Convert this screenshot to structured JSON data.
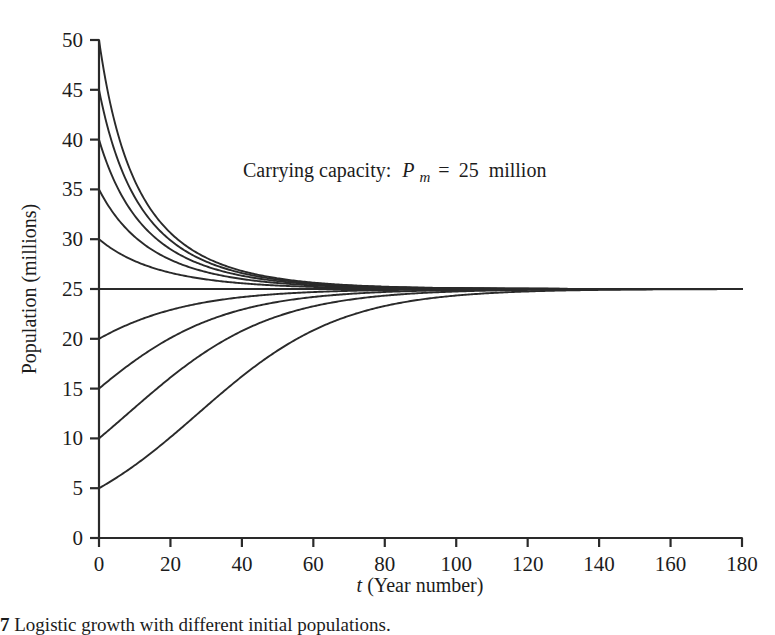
{
  "figure": {
    "caption_number": "7",
    "caption_text": "Logistic growth with different initial populations."
  },
  "annotation": {
    "prefix": "Carrying capacity:",
    "symbol": "P",
    "subscript": "m",
    "equals": "=",
    "value": "25",
    "unit": "million",
    "full_text": "Carrying capacity: Pm = 25 million"
  },
  "chart_data": {
    "type": "line",
    "title": "",
    "subtitle": "",
    "xlabel": "t (Year number)",
    "ylabel": "Population (millions)",
    "xlim": [
      0,
      180
    ],
    "ylim": [
      0,
      50
    ],
    "xticks": [
      0,
      20,
      40,
      60,
      80,
      100,
      120,
      140,
      160,
      180
    ],
    "yticks": [
      0,
      5,
      10,
      15,
      20,
      25,
      30,
      35,
      40,
      45,
      50
    ],
    "grid": false,
    "legend": "none",
    "carrying_capacity": 25,
    "growth_rate": 0.05,
    "model": "logistic",
    "annotations": [
      {
        "text": "Carrying capacity: Pm = 25 million",
        "x": 90,
        "y": 39
      }
    ],
    "series": [
      {
        "name": "P0 = 50",
        "initial_population": 50,
        "color": "#2a2a2a"
      },
      {
        "name": "P0 = 45",
        "initial_population": 45,
        "color": "#2a2a2a"
      },
      {
        "name": "P0 = 40",
        "initial_population": 40,
        "color": "#2a2a2a"
      },
      {
        "name": "P0 = 35",
        "initial_population": 35,
        "color": "#2a2a2a"
      },
      {
        "name": "P0 = 30",
        "initial_population": 30,
        "color": "#2a2a2a"
      },
      {
        "name": "P0 = 25",
        "initial_population": 25,
        "color": "#2a2a2a"
      },
      {
        "name": "P0 = 20",
        "initial_population": 20,
        "color": "#2a2a2a"
      },
      {
        "name": "P0 = 15",
        "initial_population": 15,
        "color": "#2a2a2a"
      },
      {
        "name": "P0 = 10",
        "initial_population": 10,
        "color": "#2a2a2a"
      },
      {
        "name": "P0 = 5",
        "initial_population": 5,
        "color": "#2a2a2a"
      },
      {
        "name": "P0 = 0",
        "initial_population": 0,
        "color": "#2a2a2a"
      }
    ]
  },
  "colors": {
    "background": "#ffffff",
    "axis": "#2a2a2a",
    "curve": "#2a2a2a",
    "text": "#1c1c1c"
  }
}
